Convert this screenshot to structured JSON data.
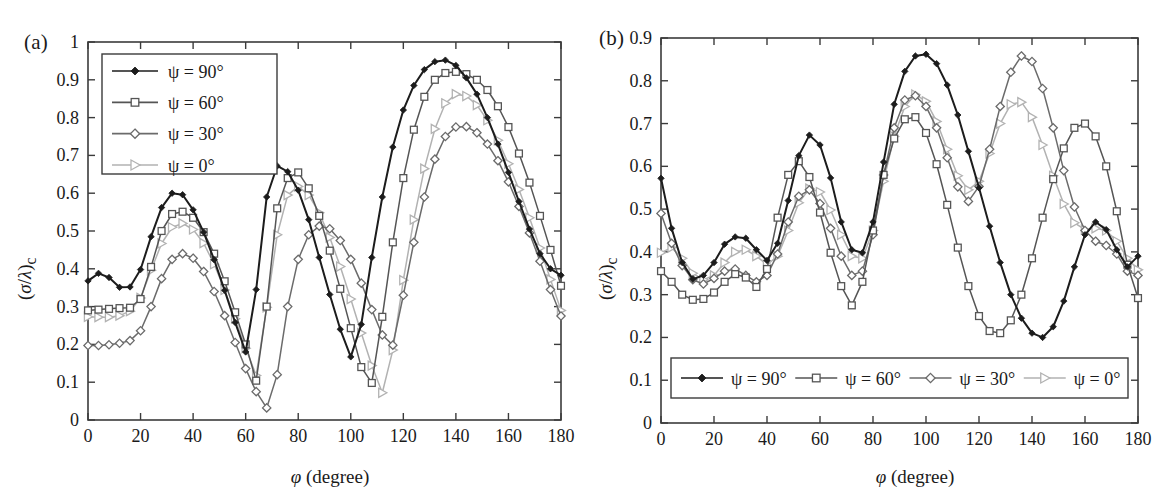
{
  "figure": {
    "panels": [
      {
        "tag": "(a)",
        "ylabel": "(σ/λ)c",
        "xlabel": "φ (degree)",
        "legend_position": "top-left-inside"
      },
      {
        "tag": "(b)",
        "ylabel": "(σ/λ)c",
        "xlabel": "φ (degree)",
        "legend_position": "bottom-inside"
      }
    ],
    "legend_labels": [
      "ψ = 90°",
      "ψ = 60°",
      "ψ = 30°",
      "ψ = 0°"
    ],
    "series_colors": [
      "#1c1c1c",
      "#555555",
      "#6b6b6b",
      "#b2b2b2"
    ],
    "marker_shapes": [
      "filled-diamond",
      "open-square",
      "open-diamond",
      "open-triangle-right"
    ]
  },
  "chart_data": [
    {
      "type": "line",
      "panel": "(a)",
      "title": "",
      "xlabel": "φ (degree)",
      "ylabel": "(σ/λ)c",
      "xlim": [
        0,
        180
      ],
      "ylim": [
        0,
        1
      ],
      "xticks": [
        0,
        20,
        40,
        60,
        80,
        100,
        120,
        140,
        160,
        180
      ],
      "yticks": [
        0,
        0.1,
        0.2,
        0.3,
        0.4,
        0.5,
        0.6,
        0.7,
        0.8,
        0.9,
        1
      ],
      "xticklabels": [
        "0",
        "20",
        "40",
        "60",
        "80",
        "100",
        "120",
        "140",
        "160",
        "180"
      ],
      "yticklabels": [
        "0",
        "0.1",
        "0.2",
        "0.3",
        "0.4",
        "0.5",
        "0.6",
        "0.7",
        "0.8",
        "0.9",
        "1"
      ],
      "grid": false,
      "legend": [
        "ψ = 90°",
        "ψ = 60°",
        "ψ = 30°",
        "ψ = 0°"
      ],
      "x": [
        0,
        4,
        8,
        12,
        16,
        20,
        24,
        28,
        32,
        36,
        40,
        44,
        48,
        52,
        56,
        60,
        64,
        68,
        72,
        76,
        80,
        84,
        88,
        92,
        96,
        100,
        104,
        108,
        112,
        116,
        120,
        124,
        128,
        132,
        136,
        140,
        144,
        148,
        152,
        156,
        160,
        164,
        168,
        172,
        176,
        180
      ],
      "series": [
        {
          "name": "ψ = 90°",
          "color": "#1c1c1c",
          "marker": "filled-diamond",
          "values": [
            0.368,
            0.388,
            0.377,
            0.351,
            0.352,
            0.398,
            0.485,
            0.562,
            0.6,
            0.596,
            0.556,
            0.497,
            0.424,
            0.343,
            0.258,
            0.18,
            0.345,
            0.59,
            0.672,
            0.657,
            0.608,
            0.53,
            0.43,
            0.332,
            0.24,
            0.167,
            0.253,
            0.43,
            0.59,
            0.722,
            0.82,
            0.885,
            0.927,
            0.948,
            0.952,
            0.938,
            0.905,
            0.862,
            0.8,
            0.73,
            0.655,
            0.578,
            0.505,
            0.44,
            0.4,
            0.383
          ]
        },
        {
          "name": "ψ = 60°",
          "color": "#555555",
          "marker": "open-square",
          "values": [
            0.29,
            0.292,
            0.294,
            0.296,
            0.297,
            0.32,
            0.405,
            0.5,
            0.545,
            0.551,
            0.535,
            0.497,
            0.44,
            0.367,
            0.285,
            0.2,
            0.104,
            0.3,
            0.56,
            0.64,
            0.655,
            0.613,
            0.54,
            0.448,
            0.347,
            0.243,
            0.14,
            0.098,
            0.273,
            0.47,
            0.64,
            0.768,
            0.855,
            0.9,
            0.918,
            0.921,
            0.915,
            0.9,
            0.873,
            0.83,
            0.775,
            0.705,
            0.628,
            0.54,
            0.45,
            0.355
          ]
        },
        {
          "name": "ψ = 30°",
          "color": "#6b6b6b",
          "marker": "open-diamond",
          "values": [
            0.197,
            0.197,
            0.199,
            0.203,
            0.21,
            0.236,
            0.3,
            0.374,
            0.425,
            0.44,
            0.428,
            0.393,
            0.34,
            0.276,
            0.205,
            0.136,
            0.075,
            0.032,
            0.12,
            0.3,
            0.425,
            0.49,
            0.513,
            0.506,
            0.475,
            0.425,
            0.362,
            0.292,
            0.225,
            0.198,
            0.33,
            0.47,
            0.59,
            0.69,
            0.75,
            0.775,
            0.776,
            0.76,
            0.73,
            0.686,
            0.63,
            0.565,
            0.495,
            0.42,
            0.345,
            0.275
          ]
        },
        {
          "name": "ψ = 0°",
          "color": "#b2b2b2",
          "marker": "open-triangle-right",
          "values": [
            0.273,
            0.272,
            0.272,
            0.276,
            0.288,
            0.323,
            0.396,
            0.467,
            0.51,
            0.52,
            0.504,
            0.468,
            0.412,
            0.344,
            0.268,
            0.19,
            0.118,
            0.298,
            0.49,
            0.595,
            0.618,
            0.595,
            0.548,
            0.483,
            0.406,
            0.32,
            0.23,
            0.144,
            0.072,
            0.185,
            0.37,
            0.53,
            0.665,
            0.77,
            0.838,
            0.862,
            0.857,
            0.833,
            0.793,
            0.74,
            0.678,
            0.61,
            0.535,
            0.455,
            0.372,
            0.29
          ]
        }
      ]
    },
    {
      "type": "line",
      "panel": "(b)",
      "title": "",
      "xlabel": "φ (degree)",
      "ylabel": "(σ/λ)c",
      "xlim": [
        0,
        180
      ],
      "ylim": [
        0,
        0.9
      ],
      "xticks": [
        0,
        20,
        40,
        60,
        80,
        100,
        120,
        140,
        160,
        180
      ],
      "yticks": [
        0,
        0.1,
        0.2,
        0.3,
        0.4,
        0.5,
        0.6,
        0.7,
        0.8,
        0.9
      ],
      "xticklabels": [
        "0",
        "20",
        "40",
        "60",
        "80",
        "100",
        "120",
        "140",
        "160",
        "180"
      ],
      "yticklabels": [
        "0",
        "0.1",
        "0.2",
        "0.3",
        "0.4",
        "0.5",
        "0.6",
        "0.7",
        "0.8",
        "0.9"
      ],
      "grid": false,
      "legend": [
        "ψ = 90°",
        "ψ = 60°",
        "ψ = 30°",
        "ψ = 0°"
      ],
      "x": [
        0,
        4,
        8,
        12,
        16,
        20,
        24,
        28,
        32,
        36,
        40,
        44,
        48,
        52,
        56,
        60,
        64,
        68,
        72,
        76,
        80,
        84,
        88,
        92,
        96,
        100,
        104,
        108,
        112,
        116,
        120,
        124,
        128,
        132,
        136,
        140,
        144,
        148,
        152,
        156,
        160,
        164,
        168,
        172,
        176,
        180
      ],
      "series": [
        {
          "name": "ψ = 90°",
          "color": "#1c1c1c",
          "marker": "filled-diamond",
          "values": [
            0.572,
            0.455,
            0.375,
            0.336,
            0.345,
            0.375,
            0.418,
            0.435,
            0.432,
            0.405,
            0.38,
            0.42,
            0.52,
            0.625,
            0.673,
            0.65,
            0.573,
            0.47,
            0.405,
            0.398,
            0.47,
            0.61,
            0.745,
            0.822,
            0.858,
            0.862,
            0.84,
            0.79,
            0.72,
            0.635,
            0.55,
            0.46,
            0.375,
            0.3,
            0.245,
            0.21,
            0.2,
            0.225,
            0.285,
            0.365,
            0.44,
            0.47,
            0.452,
            0.405,
            0.365,
            0.39
          ]
        },
        {
          "name": "ψ = 60°",
          "color": "#555555",
          "marker": "open-square",
          "values": [
            0.355,
            0.33,
            0.3,
            0.288,
            0.29,
            0.305,
            0.33,
            0.348,
            0.34,
            0.318,
            0.36,
            0.48,
            0.58,
            0.612,
            0.575,
            0.492,
            0.398,
            0.32,
            0.275,
            0.33,
            0.45,
            0.58,
            0.665,
            0.71,
            0.715,
            0.678,
            0.605,
            0.51,
            0.41,
            0.32,
            0.25,
            0.215,
            0.21,
            0.24,
            0.3,
            0.385,
            0.48,
            0.57,
            0.642,
            0.69,
            0.7,
            0.67,
            0.6,
            0.495,
            0.37,
            0.292
          ]
        },
        {
          "name": "ψ = 30°",
          "color": "#6b6b6b",
          "marker": "open-diamond",
          "values": [
            0.49,
            0.42,
            0.368,
            0.335,
            0.325,
            0.338,
            0.355,
            0.36,
            0.345,
            0.33,
            0.345,
            0.395,
            0.47,
            0.53,
            0.545,
            0.513,
            0.455,
            0.39,
            0.345,
            0.355,
            0.44,
            0.58,
            0.69,
            0.755,
            0.765,
            0.74,
            0.69,
            0.62,
            0.552,
            0.518,
            0.553,
            0.64,
            0.74,
            0.82,
            0.858,
            0.845,
            0.782,
            0.69,
            0.59,
            0.505,
            0.45,
            0.425,
            0.415,
            0.395,
            0.355,
            0.345
          ]
        },
        {
          "name": "ψ = 0°",
          "color": "#b2b2b2",
          "marker": "open-triangle-right",
          "values": [
            0.398,
            0.41,
            0.385,
            0.35,
            0.335,
            0.345,
            0.375,
            0.4,
            0.405,
            0.39,
            0.37,
            0.39,
            0.45,
            0.515,
            0.548,
            0.54,
            0.498,
            0.44,
            0.39,
            0.385,
            0.45,
            0.565,
            0.67,
            0.74,
            0.768,
            0.752,
            0.705,
            0.64,
            0.578,
            0.545,
            0.565,
            0.63,
            0.7,
            0.745,
            0.75,
            0.715,
            0.65,
            0.578,
            0.512,
            0.468,
            0.452,
            0.455,
            0.45,
            0.425,
            0.385,
            0.358
          ]
        }
      ]
    }
  ]
}
